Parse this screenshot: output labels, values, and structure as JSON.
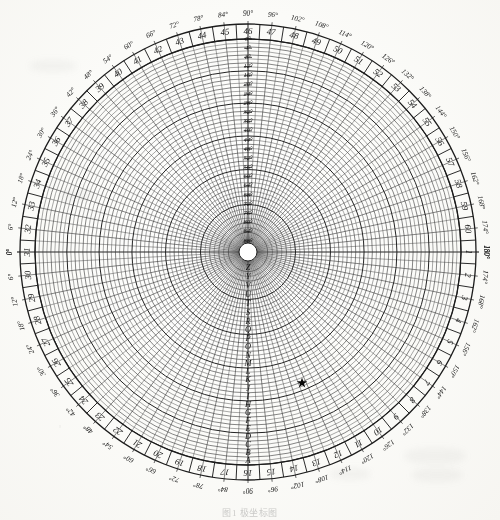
{
  "figure": {
    "caption": "图1  极坐标图",
    "background_color": "#fbfbf8",
    "ink_color": "#232323"
  },
  "geometry": {
    "center_x": 248,
    "center_y": 252,
    "radius_outer": 228,
    "radius_band_inner": 213,
    "radius_inner_hub": 9
  },
  "outer_scale": {
    "name": "minute-ring",
    "note": "sector numbers 1-60 read clockwise from the right-hand 180-degree mark",
    "count": 60,
    "labels": [
      "1",
      "2",
      "3",
      "4",
      "5",
      "6",
      "7",
      "8",
      "9",
      "10",
      "11",
      "12",
      "13",
      "14",
      "15",
      "16",
      "17",
      "18",
      "19",
      "20",
      "21",
      "22",
      "23",
      "24",
      "25",
      "26",
      "27",
      "28",
      "29",
      "30",
      "31",
      "32",
      "33",
      "34",
      "35",
      "36",
      "37",
      "38",
      "39",
      "40",
      "41",
      "42",
      "43",
      "44",
      "45",
      "46",
      "47",
      "48",
      "49",
      "50",
      "51",
      "52",
      "53",
      "54",
      "55",
      "56",
      "57",
      "58",
      "59",
      "60"
    ]
  },
  "degree_scale": {
    "name": "azimuth-ring",
    "step": 6,
    "suffix": "°",
    "upper_labels": [
      "0°",
      "6°",
      "12°",
      "18°",
      "24°",
      "30°",
      "36°",
      "42°",
      "48°",
      "54°",
      "60°",
      "66°",
      "72°",
      "78°",
      "84°",
      "90°",
      "96°",
      "102°",
      "108°",
      "114°",
      "120°",
      "126°",
      "132°",
      "138°",
      "144°",
      "150°",
      "156°",
      "162°",
      "168°",
      "174°",
      "180°"
    ],
    "lower_labels": [
      "0°",
      "6°",
      "12°",
      "18°",
      "24°",
      "30°",
      "36°",
      "42°",
      "48°",
      "54°",
      "60°",
      "66°",
      "72°",
      "78°",
      "84°",
      "90°",
      "96°",
      "102°",
      "108°",
      "114°",
      "120°",
      "126°",
      "132°",
      "138°",
      "144°",
      "150°",
      "156°",
      "162°",
      "168°",
      "174°",
      "180°"
    ]
  },
  "vertical_scale": {
    "name": "elevation-scale",
    "axis": "upper vertical radius",
    "step": 4,
    "suffix": "°",
    "labels": [
      "0°",
      "4°",
      "8°",
      "12°",
      "16°",
      "20°",
      "24°",
      "28°",
      "32°",
      "36°",
      "40°",
      "44°",
      "48°",
      "52°",
      "56°",
      "60°",
      "64°",
      "68°",
      "72°",
      "76°",
      "80°",
      "84°",
      "88°"
    ]
  },
  "ring_scale": {
    "name": "range-ring-letters",
    "axis": "lower vertical radius",
    "labels": [
      "Z",
      "Y",
      "V",
      "U",
      "T",
      "S",
      "R",
      "Q",
      "P",
      "O",
      "N",
      "M",
      "L",
      "K",
      "J",
      "I",
      "H",
      "G",
      "F",
      "E",
      "D",
      "C",
      "B",
      "A"
    ]
  },
  "marker": {
    "name": "plot-marker",
    "symbol": "★",
    "x": 302,
    "y": 383,
    "color": "#090909",
    "size": 11
  }
}
